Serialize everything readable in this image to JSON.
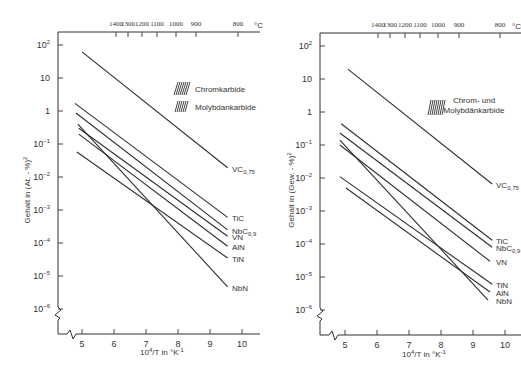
{
  "chart_data": [
    {
      "type": "line",
      "panel": "left",
      "xlabel": "10^4/T in °K^-1",
      "ylabel": "Gehalt in (At.-%)^2",
      "yscale": "log",
      "xlim": [
        4.3,
        10.5
      ],
      "ylim": [
        1e-07,
        200
      ],
      "x_ticks": [
        5,
        6,
        7,
        8,
        9,
        10
      ],
      "y_ticks": [
        "10^2",
        "10",
        "1",
        "10^-1",
        "10^-2",
        "10^-3",
        "10^-4",
        "10^-5",
        "10^-6"
      ],
      "top_axis": {
        "unit": "°C",
        "ticks": [
          1400,
          1300,
          1200,
          1100,
          1000,
          900,
          800
        ]
      },
      "legend": [
        "Chromkarbide",
        "Molybdankarbide"
      ],
      "series": [
        {
          "name": "VC0,75",
          "label": "VC",
          "sub": "0,75",
          "x": [
            5.0,
            9.55
          ],
          "y": [
            62,
            0.019
          ]
        },
        {
          "name": "TiC",
          "label": "TiC",
          "sub": "",
          "x": [
            4.78,
            9.55
          ],
          "y": [
            1.7,
            0.0006
          ]
        },
        {
          "name": "NbC0,9",
          "label": "NbC",
          "sub": "0,9",
          "x": [
            4.81,
            9.55
          ],
          "y": [
            0.87,
            0.00025
          ]
        },
        {
          "name": "VN",
          "label": "VN",
          "sub": "",
          "x": [
            4.9,
            9.55
          ],
          "y": [
            0.3,
            0.00016
          ]
        },
        {
          "name": "AlN",
          "label": "AlN",
          "sub": "",
          "x": [
            4.9,
            9.55
          ],
          "y": [
            0.2,
            8e-05
          ]
        },
        {
          "name": "TiN",
          "label": "TiN",
          "sub": "",
          "x": [
            4.84,
            9.55
          ],
          "y": [
            0.057,
            3.5e-05
          ]
        },
        {
          "name": "NbN",
          "label": "NbN",
          "sub": "",
          "x": [
            4.87,
            9.55
          ],
          "y": [
            0.4,
            4.7e-06
          ]
        }
      ]
    },
    {
      "type": "line",
      "panel": "right",
      "xlabel": "10^4/T in °K^-1",
      "ylabel": "Gehalt in (Gew.-%)^2",
      "yscale": "log",
      "xlim": [
        4.3,
        10.5
      ],
      "ylim": [
        1e-07,
        200
      ],
      "x_ticks": [
        5,
        6,
        7,
        8,
        9,
        10
      ],
      "y_ticks": [
        "10^2",
        "10",
        "1",
        "10^-1",
        "10^-2",
        "10^-3",
        "10^-4",
        "10^-5",
        "10^-6"
      ],
      "top_axis": {
        "unit": "°C",
        "ticks": [
          1400,
          1300,
          1200,
          1100,
          1000,
          900,
          800
        ]
      },
      "legend": [
        "Chrom- und Molybdänkarbide"
      ],
      "series": [
        {
          "name": "VC0,75",
          "label": "VC",
          "sub": "0,75",
          "x": [
            5.09,
            9.6
          ],
          "y": [
            20,
            0.0066
          ]
        },
        {
          "name": "TiC",
          "label": "TiC",
          "sub": "",
          "x": [
            4.88,
            9.6
          ],
          "y": [
            0.44,
            0.00013
          ]
        },
        {
          "name": "NbC0,9",
          "label": "NbC",
          "sub": "0,9",
          "x": [
            4.84,
            9.6
          ],
          "y": [
            0.23,
            8e-05
          ]
        },
        {
          "name": "VN",
          "label": "VN",
          "sub": "",
          "x": [
            4.84,
            9.53
          ],
          "y": [
            0.1,
            3e-05
          ]
        },
        {
          "name": "TiN",
          "label": "TiN",
          "sub": "",
          "x": [
            4.84,
            9.6
          ],
          "y": [
            0.011,
            6e-06
          ]
        },
        {
          "name": "AlN",
          "label": "AlN",
          "sub": "",
          "x": [
            5.03,
            9.53
          ],
          "y": [
            0.005,
            3.5e-06
          ]
        },
        {
          "name": "NbN",
          "label": "NbN",
          "sub": "",
          "x": [
            4.84,
            9.47
          ],
          "y": [
            0.14,
            2e-06
          ]
        }
      ]
    }
  ],
  "panels": {
    "left": {
      "ylabel": "Gehalt in (At. - %)",
      "ylabel_exp": "2",
      "xlabel_main": "10",
      "xlabel_exp": "4",
      "xlabel_rest": "/T in °K",
      "xlabel_exp2": "-1",
      "unit_top": "°C",
      "legend_1": "Chromkarbide",
      "legend_2": "Molybdankarbide"
    },
    "right": {
      "ylabel": "Gehalt in (Gew. - %)",
      "ylabel_exp": "2",
      "xlabel_main": "10",
      "xlabel_exp": "4",
      "xlabel_rest": "/T in °K",
      "xlabel_exp2": "-1",
      "unit_top": "°C",
      "legend_1": "Chrom- und",
      "legend_2": "Molybdänkarbide"
    }
  }
}
